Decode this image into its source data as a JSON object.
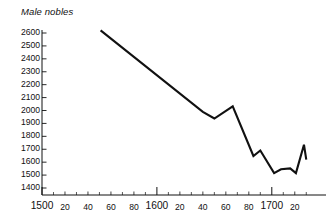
{
  "chart_data": {
    "type": "line",
    "title": "Male nobles",
    "xlabel": "",
    "ylabel": "",
    "xlim": [
      1500,
      1732
    ],
    "ylim": [
      1400,
      2650
    ],
    "grid": false,
    "legend": null,
    "y_ticks": [
      2600,
      2500,
      2400,
      2300,
      2200,
      2100,
      2000,
      1900,
      1800,
      1700,
      1600,
      1500,
      1400
    ],
    "x_ticks": [
      {
        "value": 1500,
        "label": "1500",
        "major": true
      },
      {
        "value": 1520,
        "label": "20",
        "major": false
      },
      {
        "value": 1540,
        "label": "40",
        "major": false
      },
      {
        "value": 1560,
        "label": "60",
        "major": false
      },
      {
        "value": 1580,
        "label": "80",
        "major": false
      },
      {
        "value": 1600,
        "label": "1600",
        "major": true
      },
      {
        "value": 1620,
        "label": "20",
        "major": false
      },
      {
        "value": 1640,
        "label": "40",
        "major": false
      },
      {
        "value": 1660,
        "label": "60",
        "major": false
      },
      {
        "value": 1680,
        "label": "80",
        "major": false
      },
      {
        "value": 1700,
        "label": "1700",
        "major": true
      },
      {
        "value": 1720,
        "label": "20",
        "major": false
      }
    ],
    "x_minor_ticks": [
      1510,
      1530,
      1550,
      1570,
      1590,
      1610,
      1630,
      1650,
      1670,
      1690,
      1710,
      1730
    ],
    "series": [
      {
        "name": "Male nobles",
        "color": "#111111",
        "x": [
          1551,
          1640,
          1650,
          1666,
          1684,
          1690,
          1702,
          1708,
          1716,
          1721,
          1728,
          1730
        ],
        "y": [
          2620,
          1990,
          1938,
          2032,
          1648,
          1690,
          1515,
          1545,
          1552,
          1515,
          1735,
          1620
        ]
      }
    ]
  },
  "axes": {
    "y_axis_color": "#111111",
    "x_axis_color": "#111111"
  }
}
